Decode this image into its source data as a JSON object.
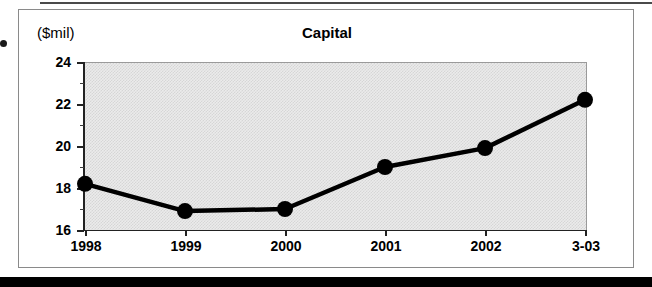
{
  "figure": {
    "title": "Capital",
    "y_axis_unit": "($mil)"
  },
  "chart_data": {
    "type": "line",
    "title": "Capital",
    "xlabel": "",
    "ylabel": "($mil)",
    "unit": "$mil",
    "categories": [
      "1998",
      "1999",
      "2000",
      "2001",
      "2002",
      "3-03"
    ],
    "values": [
      18.2,
      16.9,
      17.0,
      19.0,
      19.9,
      22.2
    ],
    "series": [
      {
        "name": "Capital",
        "values": [
          18.2,
          16.9,
          17.0,
          19.0,
          19.9,
          22.2
        ]
      }
    ],
    "ylim": [
      16,
      24
    ],
    "ytick_labels": [
      "16",
      "18",
      "20",
      "22",
      "24"
    ],
    "ytick_values": [
      16,
      18,
      20,
      22,
      24
    ],
    "minor_ytick_values": [
      17,
      19,
      21,
      23
    ],
    "grid": false,
    "legend": false,
    "marker": "filled-circle",
    "marker_color": "#000000",
    "line_color": "#000000",
    "plot_background": "#ebebeb"
  }
}
